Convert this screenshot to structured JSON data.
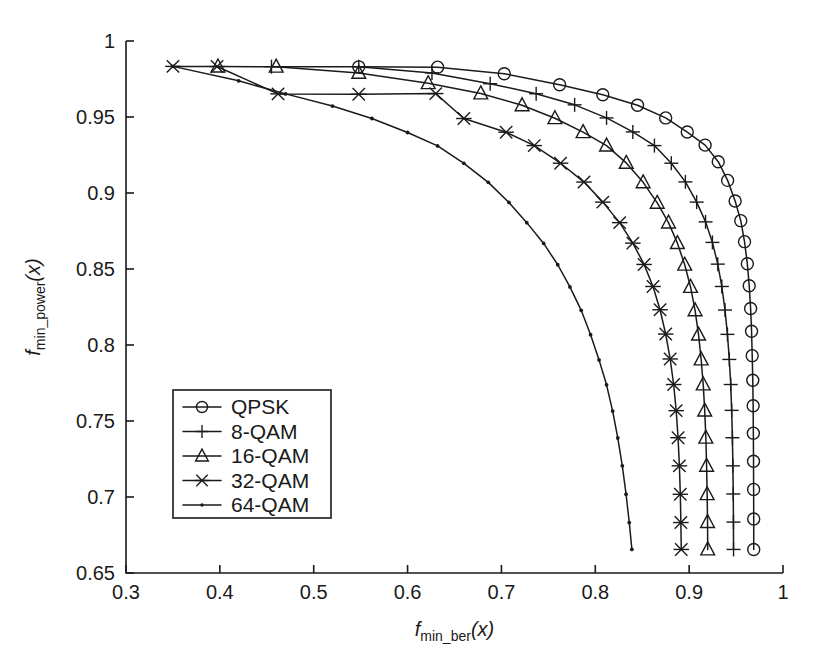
{
  "figure": {
    "background_color": "#ffffff",
    "line_color": "#1a1a1a",
    "width": 817,
    "height": 670
  },
  "axes": {
    "x": {
      "label_main": "f",
      "label_sub": "min_ber",
      "label_arg": "(x)",
      "min": 0.3,
      "max": 1.0,
      "ticks": [
        0.3,
        0.4,
        0.5,
        0.6,
        0.7,
        0.8,
        0.9,
        1.0
      ],
      "tick_labels": [
        "0.3",
        "0.4",
        "0.5",
        "0.6",
        "0.7",
        "0.8",
        "0.9",
        "1"
      ]
    },
    "y": {
      "label_main": "f",
      "label_sub": "min_power",
      "label_arg": "(x)",
      "min": 0.65,
      "max": 1.0,
      "ticks": [
        0.65,
        0.7,
        0.75,
        0.8,
        0.85,
        0.9,
        0.95,
        1.0
      ],
      "tick_labels": [
        "0.65",
        "0.7",
        "0.75",
        "0.8",
        "0.85",
        "0.9",
        "0.95",
        "1"
      ]
    }
  },
  "legend": {
    "position": "lower-left",
    "entries": [
      {
        "label": "QPSK",
        "marker": "circle-marker"
      },
      {
        "label": "8-QAM",
        "marker": "plus-marker"
      },
      {
        "label": "16-QAM",
        "marker": "triangle-marker"
      },
      {
        "label": "32-QAM",
        "marker": "asterisk-marker"
      },
      {
        "label": "64-QAM",
        "marker": "dot-marker"
      }
    ]
  },
  "chart_data": {
    "type": "line",
    "title": "",
    "xlabel": "f_min_ber(x)",
    "ylabel": "f_min_power(x)",
    "xlim": [
      0.3,
      1.0
    ],
    "ylim": [
      0.65,
      1.0
    ],
    "grid": false,
    "legend_position": "lower-left",
    "series": [
      {
        "name": "QPSK",
        "marker": "circle-marker",
        "points": [
          [
            0.548,
            0.983
          ],
          [
            0.632,
            0.9828
          ],
          [
            0.703,
            0.9785
          ],
          [
            0.762,
            0.9712
          ],
          [
            0.808,
            0.9646
          ],
          [
            0.845,
            0.9577
          ],
          [
            0.875,
            0.9494
          ],
          [
            0.898,
            0.9401
          ],
          [
            0.917,
            0.9315
          ],
          [
            0.931,
            0.9206
          ],
          [
            0.941,
            0.9083
          ],
          [
            0.949,
            0.8947
          ],
          [
            0.955,
            0.8818
          ],
          [
            0.959,
            0.868
          ],
          [
            0.962,
            0.8535
          ],
          [
            0.964,
            0.839
          ],
          [
            0.9655,
            0.824
          ],
          [
            0.9665,
            0.809
          ],
          [
            0.9672,
            0.793
          ],
          [
            0.9678,
            0.7768
          ],
          [
            0.9682,
            0.76
          ],
          [
            0.9684,
            0.742
          ],
          [
            0.9686,
            0.7235
          ],
          [
            0.9687,
            0.705
          ],
          [
            0.9688,
            0.6855
          ],
          [
            0.9688,
            0.6655
          ]
        ]
      },
      {
        "name": "8-QAM",
        "marker": "plus-marker",
        "points": [
          [
            0.455,
            0.9831
          ],
          [
            0.548,
            0.983
          ],
          [
            0.626,
            0.979
          ],
          [
            0.688,
            0.9719
          ],
          [
            0.737,
            0.9653
          ],
          [
            0.778,
            0.958
          ],
          [
            0.812,
            0.9494
          ],
          [
            0.84,
            0.9402
          ],
          [
            0.863,
            0.9312
          ],
          [
            0.881,
            0.9196
          ],
          [
            0.896,
            0.9073
          ],
          [
            0.908,
            0.894
          ],
          [
            0.9175,
            0.881
          ],
          [
            0.9248,
            0.8675
          ],
          [
            0.9305,
            0.8532
          ],
          [
            0.9348,
            0.8385
          ],
          [
            0.9382,
            0.823
          ],
          [
            0.9408,
            0.807
          ],
          [
            0.9428,
            0.7905
          ],
          [
            0.9443,
            0.774
          ],
          [
            0.9453,
            0.757
          ],
          [
            0.9461,
            0.739
          ],
          [
            0.9466,
            0.7205
          ],
          [
            0.947,
            0.702
          ],
          [
            0.9472,
            0.6835
          ],
          [
            0.9473,
            0.6655
          ]
        ]
      },
      {
        "name": "16-QAM",
        "marker": "triangle-marker",
        "points": [
          [
            0.398,
            0.9832
          ],
          [
            0.46,
            0.9831
          ],
          [
            0.548,
            0.979
          ],
          [
            0.622,
            0.9722
          ],
          [
            0.678,
            0.9655
          ],
          [
            0.722,
            0.9577
          ],
          [
            0.757,
            0.9492
          ],
          [
            0.787,
            0.94
          ],
          [
            0.812,
            0.9312
          ],
          [
            0.833,
            0.9198
          ],
          [
            0.851,
            0.907
          ],
          [
            0.866,
            0.8935
          ],
          [
            0.878,
            0.8805
          ],
          [
            0.8875,
            0.867
          ],
          [
            0.8953,
            0.8528
          ],
          [
            0.9015,
            0.8382
          ],
          [
            0.9063,
            0.8228
          ],
          [
            0.91,
            0.8068
          ],
          [
            0.9128,
            0.7905
          ],
          [
            0.915,
            0.774
          ],
          [
            0.9166,
            0.7568
          ],
          [
            0.9178,
            0.739
          ],
          [
            0.9186,
            0.7205
          ],
          [
            0.9192,
            0.7018
          ],
          [
            0.9196,
            0.6835
          ],
          [
            0.9198,
            0.6655
          ]
        ]
      },
      {
        "name": "32-QAM",
        "marker": "asterisk-marker",
        "points": [
          [
            0.35,
            0.9833
          ],
          [
            0.397,
            0.9832
          ],
          [
            0.462,
            0.9652
          ],
          [
            0.548,
            0.965
          ],
          [
            0.63,
            0.9654
          ],
          [
            0.66,
            0.949
          ],
          [
            0.705,
            0.94
          ],
          [
            0.735,
            0.9312
          ],
          [
            0.763,
            0.9196
          ],
          [
            0.788,
            0.9072
          ],
          [
            0.808,
            0.894
          ],
          [
            0.826,
            0.8805
          ],
          [
            0.84,
            0.867
          ],
          [
            0.852,
            0.853
          ],
          [
            0.8615,
            0.8385
          ],
          [
            0.869,
            0.8232
          ],
          [
            0.875,
            0.8072
          ],
          [
            0.8798,
            0.7908
          ],
          [
            0.8835,
            0.774
          ],
          [
            0.8862,
            0.7568
          ],
          [
            0.8882,
            0.739
          ],
          [
            0.8896,
            0.7205
          ],
          [
            0.8906,
            0.7018
          ],
          [
            0.8912,
            0.6832
          ],
          [
            0.8916,
            0.6655
          ]
        ]
      },
      {
        "name": "64-QAM",
        "marker": "dot-marker",
        "points": [
          [
            0.35,
            0.9833
          ],
          [
            0.42,
            0.9738
          ],
          [
            0.47,
            0.9652
          ],
          [
            0.52,
            0.9572
          ],
          [
            0.562,
            0.949
          ],
          [
            0.6,
            0.9398
          ],
          [
            0.632,
            0.931
          ],
          [
            0.66,
            0.9195
          ],
          [
            0.686,
            0.907
          ],
          [
            0.708,
            0.8938
          ],
          [
            0.727,
            0.8805
          ],
          [
            0.745,
            0.8668
          ],
          [
            0.76,
            0.8528
          ],
          [
            0.773,
            0.8382
          ],
          [
            0.785,
            0.8228
          ],
          [
            0.795,
            0.8068
          ],
          [
            0.804,
            0.7902
          ],
          [
            0.812,
            0.7738
          ],
          [
            0.8185,
            0.7565
          ],
          [
            0.824,
            0.7388
          ],
          [
            0.8288,
            0.7205
          ],
          [
            0.8328,
            0.7018
          ],
          [
            0.8362,
            0.6832
          ],
          [
            0.839,
            0.6655
          ]
        ]
      }
    ]
  }
}
